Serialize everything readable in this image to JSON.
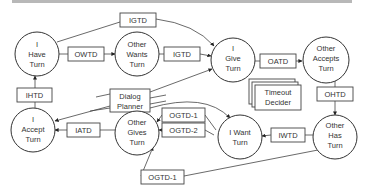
{
  "diagram": {
    "title": "",
    "nodes": [
      {
        "id": "i_have_turn",
        "lines": [
          "I",
          "Have",
          "Turn"
        ]
      },
      {
        "id": "other_wants_turn",
        "lines": [
          "Other",
          "Wants",
          "Turn"
        ]
      },
      {
        "id": "i_give_turn",
        "lines": [
          "I",
          "Give",
          "Turn"
        ]
      },
      {
        "id": "other_accepts_turn",
        "lines": [
          "Other",
          "Accepts",
          "Turn"
        ]
      },
      {
        "id": "i_accept_turn",
        "lines": [
          "I",
          "Accept",
          "Turn"
        ]
      },
      {
        "id": "other_gives_turn",
        "lines": [
          "Other",
          "Gives",
          "Turn"
        ]
      },
      {
        "id": "i_want_turn",
        "lines": [
          "I Want",
          "Turn"
        ]
      },
      {
        "id": "other_has_turn",
        "lines": [
          "Other",
          "Has",
          "Turn"
        ]
      }
    ],
    "boxes": {
      "igtd_top": "IGTD",
      "owtd": "OWTD",
      "igtd_mid": "IGTD",
      "oatd": "OATD",
      "timeout_decider": [
        "Timeout",
        "Decider"
      ],
      "ohtd": "OHTD",
      "ihtd": "IHTD",
      "dialog_planner": [
        "Dialog",
        "Planner"
      ],
      "ogtd1_top": "OGTD-1",
      "ogtd2": "OGTD-2",
      "iatd": "IATD",
      "iwtd": "IWTD",
      "ogtd1_bottom": "OGTD-1"
    },
    "edges": [
      {
        "from": "I Have Turn",
        "via": "IGTD",
        "to": "I Give Turn"
      },
      {
        "from": "I Have Turn",
        "via": "OWTD",
        "to": "Other Wants Turn"
      },
      {
        "from": "Other Wants Turn",
        "via": "IGTD",
        "to": "I Give Turn"
      },
      {
        "from": "Dialog Planner",
        "to": "I Give Turn"
      },
      {
        "from": "I Give Turn",
        "via": "OATD",
        "to": "Other Accepts Turn"
      },
      {
        "from": "Other Accepts Turn",
        "via": "OHTD",
        "to": "Other Has Turn"
      },
      {
        "from": "Other Has Turn",
        "via": "IWTD",
        "to": "I Want Turn"
      },
      {
        "from": "Other Has Turn",
        "via": "OGTD-1",
        "to": "Other Gives Turn"
      },
      {
        "from": "I Want Turn",
        "via": "OGTD-1",
        "to": "Other Gives Turn"
      },
      {
        "from": "I Want Turn",
        "via": "OGTD-2",
        "to": "Other Gives Turn"
      },
      {
        "from": "Dialog Planner",
        "to": "I Want Turn"
      },
      {
        "from": "Other Gives Turn",
        "via": "IATD",
        "to": "I Accept Turn"
      },
      {
        "from": "Dialog Planner",
        "to": "I Accept Turn"
      },
      {
        "from": "I Accept Turn",
        "via": "IHTD",
        "to": "I Have Turn"
      }
    ]
  }
}
